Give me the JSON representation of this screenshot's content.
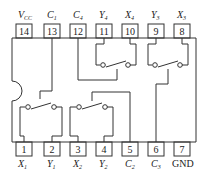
{
  "diagram": {
    "type": "ic-pinout",
    "top_pins": [
      {
        "num": "14",
        "label": "V",
        "sub": "CC"
      },
      {
        "num": "13",
        "label": "C",
        "sub": "1"
      },
      {
        "num": "12",
        "label": "C",
        "sub": "4"
      },
      {
        "num": "11",
        "label": "Y",
        "sub": "4"
      },
      {
        "num": "10",
        "label": "X",
        "sub": "4"
      },
      {
        "num": "9",
        "label": "Y",
        "sub": "3"
      },
      {
        "num": "8",
        "label": "X",
        "sub": "3"
      }
    ],
    "bottom_pins": [
      {
        "num": "1",
        "label": "X",
        "sub": "1"
      },
      {
        "num": "2",
        "label": "Y",
        "sub": "1"
      },
      {
        "num": "3",
        "label": "X",
        "sub": "2"
      },
      {
        "num": "4",
        "label": "Y",
        "sub": "2"
      },
      {
        "num": "5",
        "label": "C",
        "sub": "2"
      },
      {
        "num": "6",
        "label": "C",
        "sub": "3"
      },
      {
        "num": "7",
        "label": "GND",
        "sub": ""
      }
    ],
    "colors": {
      "line": "#333333",
      "background": "#ffffff"
    }
  }
}
